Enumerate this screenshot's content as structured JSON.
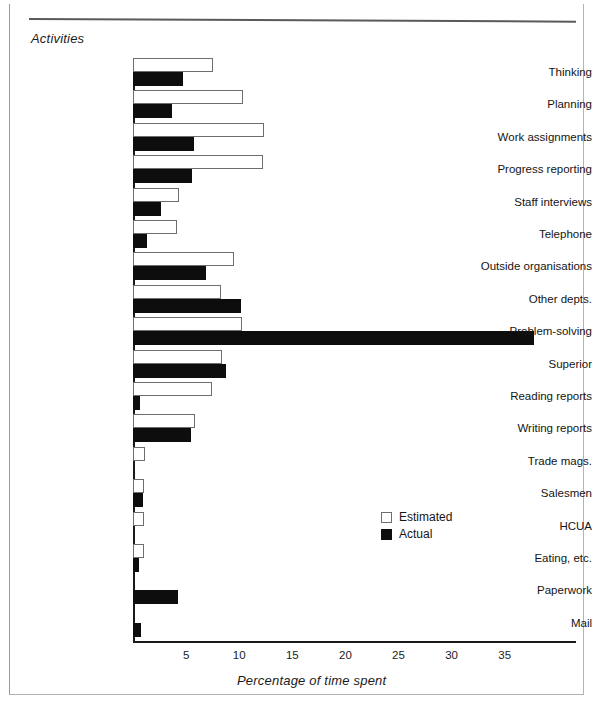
{
  "figure": {
    "y_axis_title": "Activities",
    "x_axis_title": "Percentage of time spent"
  },
  "legend": {
    "position": "center-right",
    "items": [
      {
        "label": "Estimated",
        "swatch": "open-square-white",
        "color": "#ffffff"
      },
      {
        "label": "Actual",
        "swatch": "filled-square-black",
        "color": "#0d0d0d"
      }
    ]
  },
  "chart_data": {
    "type": "bar",
    "orientation": "horizontal",
    "title": "",
    "xlabel": "Percentage of time spent",
    "ylabel": "Activities",
    "xlim": [
      0,
      39
    ],
    "grid": false,
    "legend_position": "center-right",
    "tick_labels": [
      "5",
      "10",
      "15",
      "20",
      "25",
      "30",
      "35"
    ],
    "ticks": [
      5,
      10,
      15,
      20,
      25,
      30,
      35
    ],
    "categories": [
      "Thinking",
      "Planning",
      "Work assignments",
      "Progress reporting",
      "Staff interviews",
      "Telephone",
      "Outside organisations",
      "Other depts.",
      "Problem-solving",
      "Superior",
      "Reading reports",
      "Writing reports",
      "Trade mags.",
      "Salesmen",
      "HCUA",
      "Eating, etc.",
      "Paperwork",
      "Mail"
    ],
    "series": [
      {
        "name": "Estimated",
        "color": "#ffffff",
        "values": [
          7.5,
          10.4,
          12.3,
          12.2,
          4.3,
          4.1,
          9.5,
          8.3,
          10.3,
          8.4,
          7.4,
          5.8,
          1.1,
          1.0,
          1.0,
          1.0,
          0.0,
          0.0
        ]
      },
      {
        "name": "Actual",
        "color": "#0d0d0d",
        "values": [
          4.7,
          3.7,
          5.7,
          5.6,
          2.6,
          1.3,
          6.9,
          10.2,
          37.8,
          8.8,
          0.7,
          5.5,
          0.0,
          0.9,
          0.0,
          0.6,
          4.2,
          0.8
        ]
      }
    ]
  }
}
